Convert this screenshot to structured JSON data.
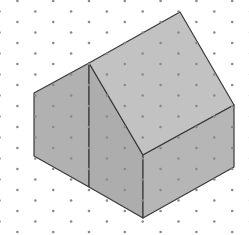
{
  "figure": {
    "width": 249,
    "height": 235,
    "background": "#ffffff"
  },
  "grid": {
    "type": "isometric-dots",
    "dot_color": "#8a8a8a",
    "dot_radius": 1.3,
    "col_spacing": 17.9,
    "row_spacing": 21,
    "x_origin": -0.5,
    "y_origin_even": 22,
    "y_origin_odd": 11.5
  },
  "shape": {
    "stroke": "#3a3a3a",
    "stroke_width": 1.2,
    "faces": [
      {
        "name": "left-wall",
        "fill": "#b1b1b1",
        "points": "34,93 89,63 89,187 34,156"
      },
      {
        "name": "gable-end",
        "fill": "#adadad",
        "points": "89,63 143,155 143,218 89,187"
      },
      {
        "name": "roof",
        "fill": "#c2c2c2",
        "points": "89,63 180,12 234,105 143,155"
      },
      {
        "name": "right-wall",
        "fill": "#b6b6b6",
        "points": "143,155 234,105 234,167 143,218"
      }
    ]
  }
}
